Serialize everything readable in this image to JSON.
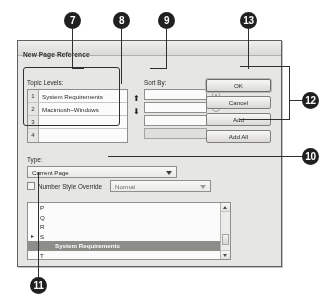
{
  "dialog": {
    "title": "New Page Reference",
    "topic": {
      "label": "Topic Levels:",
      "levels": [
        {
          "num": "1",
          "value": "System Requirements"
        },
        {
          "num": "2",
          "value": "Macintosh~Windows"
        },
        {
          "num": "3",
          "value": ""
        },
        {
          "num": "4",
          "value": ""
        }
      ]
    },
    "sort": {
      "label": "Sort By:",
      "rows": [
        {
          "value": "",
          "disabled": false
        },
        {
          "value": "",
          "disabled": false
        },
        {
          "value": "",
          "disabled": false
        },
        {
          "value": "",
          "disabled": true
        }
      ],
      "arrow_up": "⬆",
      "arrow_down": "⬇"
    },
    "buttons": [
      {
        "label": "OK",
        "default": true
      },
      {
        "label": "Cancel",
        "default": false
      },
      {
        "label": "Add",
        "default": false
      },
      {
        "label": "Add All",
        "default": false
      }
    ],
    "type": {
      "label": "Type:",
      "value": "Current Page"
    },
    "override": {
      "label": "Number Style Override",
      "checked": false,
      "style_value": "Normal"
    },
    "list": {
      "items": [
        {
          "text": "P",
          "marker": "",
          "selected": false
        },
        {
          "text": "Q",
          "marker": "",
          "selected": false
        },
        {
          "text": "R",
          "marker": "",
          "selected": false
        },
        {
          "text": "S",
          "marker": "▸",
          "selected": false
        },
        {
          "text": "System Requirements",
          "marker": "",
          "selected": true
        },
        {
          "text": "T",
          "marker": "",
          "selected": false
        }
      ]
    }
  },
  "callouts": [
    {
      "id": "7",
      "x": 64,
      "y": 12
    },
    {
      "id": "8",
      "x": 113,
      "y": 12
    },
    {
      "id": "9",
      "x": 158,
      "y": 12
    },
    {
      "id": "13",
      "x": 240,
      "y": 12
    },
    {
      "id": "12",
      "x": 300,
      "y": 92
    },
    {
      "id": "10",
      "x": 300,
      "y": 148
    },
    {
      "id": "11",
      "x": 30,
      "y": 277
    }
  ]
}
